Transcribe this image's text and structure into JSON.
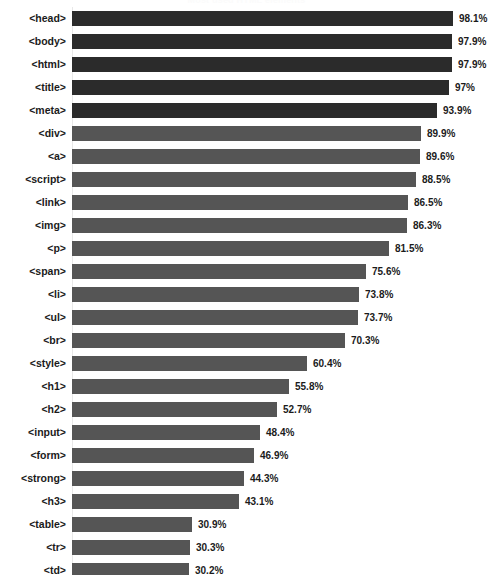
{
  "chart_data": {
    "type": "bar",
    "orientation": "horizontal",
    "title": "Most used HTML elements",
    "xlabel": "",
    "ylabel": "",
    "xlim": [
      0,
      100
    ],
    "grid": false,
    "legend": false,
    "value_suffix": "%",
    "categories": [
      "<head>",
      "<body>",
      "<html>",
      "<title>",
      "<meta>",
      "<div>",
      "<a>",
      "<script>",
      "<link>",
      "<img>",
      "<p>",
      "<span>",
      "<li>",
      "<ul>",
      "<br>",
      "<style>",
      "<h1>",
      "<h2>",
      "<input>",
      "<form>",
      "<strong>",
      "<h3>",
      "<table>",
      "<tr>",
      "<td>"
    ],
    "values": [
      98.1,
      97.9,
      97.9,
      97,
      93.9,
      89.9,
      89.6,
      88.5,
      86.5,
      86.3,
      81.5,
      75.6,
      73.8,
      73.7,
      70.3,
      60.4,
      55.8,
      52.7,
      48.4,
      46.9,
      44.3,
      43.1,
      30.9,
      30.3,
      30.2
    ],
    "value_labels": [
      "98.1%",
      "97.9%",
      "97.9%",
      "97%",
      "93.9%",
      "89.9%",
      "89.6%",
      "88.5%",
      "86.5%",
      "86.3%",
      "81.5%",
      "75.6%",
      "73.8%",
      "73.7%",
      "70.3%",
      "60.4%",
      "55.8%",
      "52.7%",
      "48.4%",
      "46.9%",
      "44.3%",
      "43.1%",
      "30.9%",
      "30.3%",
      "30.2%"
    ],
    "bar_colors": [
      "#2b2b2b",
      "#2b2b2b",
      "#2b2b2b",
      "#2b2b2b",
      "#2b2b2b",
      "#555555",
      "#555555",
      "#555555",
      "#555555",
      "#555555",
      "#555555",
      "#555555",
      "#555555",
      "#555555",
      "#555555",
      "#555555",
      "#555555",
      "#555555",
      "#555555",
      "#555555",
      "#555555",
      "#555555",
      "#555555",
      "#555555",
      "#555555"
    ]
  }
}
